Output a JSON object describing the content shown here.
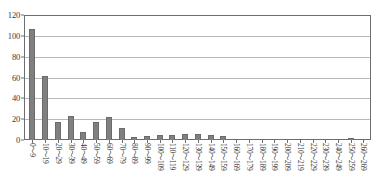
{
  "chart_data": {
    "type": "bar",
    "title": "",
    "subtitle": "",
    "xlabel": "",
    "ylabel": "",
    "ylim": [
      0,
      120
    ],
    "yticks": [
      0,
      20,
      40,
      60,
      80,
      100,
      120
    ],
    "grid": true,
    "legend": false,
    "legend_position": "none",
    "bar_color": "#808080",
    "axis_color": "#6e6e6e",
    "gridline_color": "#b9b9b9",
    "categories": [
      "0～9",
      "10～19",
      "20～29",
      "30～39",
      "40～49",
      "50～59",
      "60～69",
      "70～79",
      "80～89",
      "90～99",
      "100～109",
      "110～119",
      "120～129",
      "130～139",
      "140～149",
      "150～159",
      "160～169",
      "170～179",
      "180～189",
      "190～199",
      "200～209",
      "210～219",
      "220～229",
      "230～239",
      "240～249",
      "250～259",
      "260～269"
    ],
    "values": [
      107,
      61,
      17,
      23,
      8,
      17,
      22,
      12,
      3,
      4,
      5,
      5,
      6,
      6,
      5,
      4,
      1,
      0,
      0,
      0,
      0,
      0,
      0,
      0,
      0,
      2,
      0
    ]
  }
}
